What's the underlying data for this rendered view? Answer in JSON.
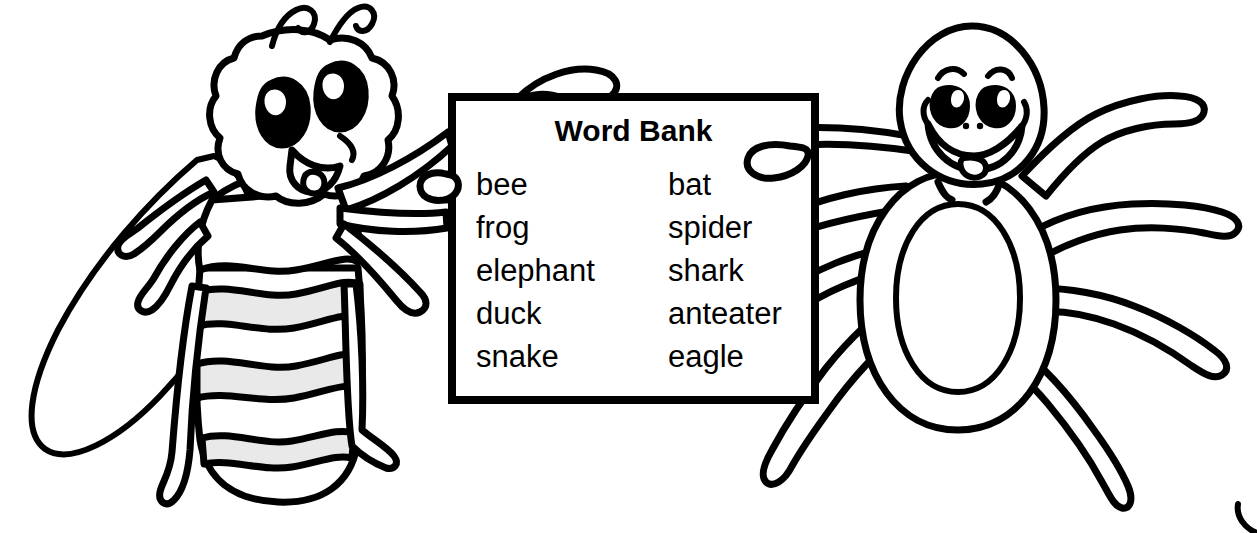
{
  "scene": {
    "title": "Word Bank coloring page with bee and spider",
    "background_color": "#ffffff",
    "ink_color": "#000000",
    "shade_color": "#e9e9e9"
  },
  "sign": {
    "heading": "Word Bank",
    "columns": [
      {
        "words": [
          "bee",
          "frog",
          "elephant",
          "duck",
          "snake"
        ]
      },
      {
        "words": [
          "bat",
          "spider",
          "shark",
          "anteater",
          "eagle"
        ]
      }
    ]
  },
  "characters": [
    {
      "name": "bee",
      "label": "bee",
      "side": "left"
    },
    {
      "name": "spider",
      "label": "spider",
      "side": "right"
    }
  ]
}
